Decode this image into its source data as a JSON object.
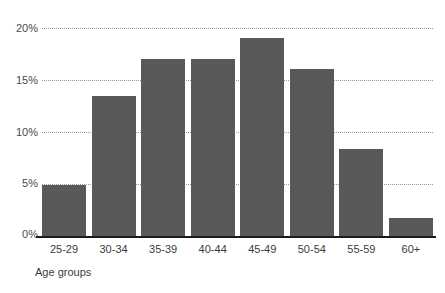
{
  "chart_data": {
    "type": "bar",
    "title": "",
    "subtitle": "",
    "xlabel": "Age groups",
    "ylabel": "",
    "categories": [
      "25-29",
      "30-34",
      "35-39",
      "40-44",
      "45-49",
      "50-54",
      "55-59",
      "60+"
    ],
    "values": [
      4.9,
      13.5,
      17.0,
      17.0,
      19.0,
      16.1,
      8.4,
      1.7
    ],
    "value_labels": [
      "",
      "",
      "",
      "",
      "",
      "",
      "",
      ""
    ],
    "ylim": [
      0,
      20
    ],
    "yticks": [
      0,
      5,
      10,
      15,
      20
    ],
    "ytick_labels": [
      "0%",
      "5%",
      "10%",
      "15%",
      "20%"
    ],
    "grid": true,
    "grid_style": "dotted-horizontal",
    "legend": false,
    "legend_position": "none",
    "series": [
      {
        "name": "share",
        "values": [
          4.9,
          13.5,
          17.0,
          17.0,
          19.0,
          16.1,
          8.4,
          1.7
        ]
      }
    ]
  },
  "colors": {
    "bar": "#595959",
    "background": "#ffffff",
    "gridline": "#9a9a9a",
    "axis": "#1c1c1c",
    "text": "#3c3c3c"
  }
}
